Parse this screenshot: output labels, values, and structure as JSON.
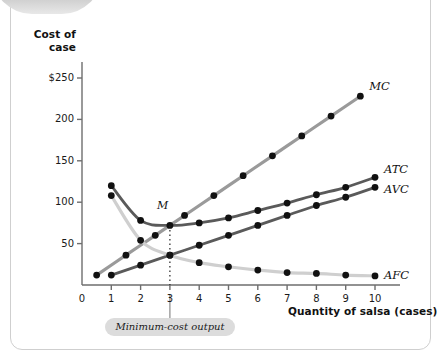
{
  "figure": {
    "y_axis_title_line1": "Cost of",
    "y_axis_title_line2": "case",
    "x_axis_title": "Quantity of salsa (cases)",
    "annotation_point": "M",
    "callout": "Minimum-cost output",
    "colors": {
      "mc": "#9a9a9a",
      "atc": "#5a5a5a",
      "avc": "#5a5a5a",
      "afc": "#cfcfcf",
      "point": "#111111",
      "axis": "#6e6e6e",
      "callout_bg": "#dcdcdc"
    }
  },
  "chart_data": {
    "type": "line",
    "title": "",
    "xlabel": "Quantity of salsa (cases)",
    "ylabel": "Cost of case",
    "xlim": [
      0,
      10.8
    ],
    "ylim": [
      0,
      262
    ],
    "grid": false,
    "legend_position": "right-of-curve-ends",
    "xticks": [
      0,
      1,
      2,
      3,
      4,
      5,
      6,
      7,
      8,
      9,
      10
    ],
    "xtick_labels": [
      "0",
      "1",
      "2",
      "3",
      "4",
      "5",
      "6",
      "7",
      "8",
      "9",
      "10"
    ],
    "yticks": [
      50,
      100,
      150,
      200,
      250
    ],
    "ytick_labels": [
      "50",
      "100",
      "150",
      "200",
      "$250"
    ],
    "annotations": [
      {
        "label": "M",
        "x": 3,
        "y": 72,
        "note": "minimum-cost output on ATC"
      },
      {
        "label": "Minimum-cost output",
        "x": 3,
        "y": 0
      }
    ],
    "series": [
      {
        "name": "MC",
        "label": "MC",
        "color": "#9a9a9a",
        "x": [
          0.5,
          1.5,
          2.5,
          3.5,
          4.5,
          5.5,
          6.5,
          7.5,
          8.5,
          9.5
        ],
        "values": [
          12,
          36,
          60,
          84,
          108,
          132,
          156,
          180,
          204,
          228
        ]
      },
      {
        "name": "ATC",
        "label": "ATC",
        "color": "#5a5a5a",
        "x": [
          1,
          2,
          3,
          4,
          5,
          6,
          7,
          8,
          9,
          10
        ],
        "values": [
          120,
          78,
          72,
          75,
          81,
          90,
          99,
          109,
          118,
          130
        ]
      },
      {
        "name": "AVC",
        "label": "AVC",
        "color": "#5a5a5a",
        "x": [
          1,
          2,
          3,
          4,
          5,
          6,
          7,
          8,
          9,
          10
        ],
        "values": [
          12,
          24,
          36,
          48,
          60,
          72,
          84,
          96,
          106,
          118
        ]
      },
      {
        "name": "AFC",
        "label": "AFC",
        "color": "#cfcfcf",
        "x": [
          1,
          2,
          3,
          4,
          5,
          6,
          7,
          8,
          9,
          10
        ],
        "values": [
          108,
          54,
          36,
          27,
          22,
          18,
          15,
          14,
          12,
          11
        ]
      }
    ]
  }
}
